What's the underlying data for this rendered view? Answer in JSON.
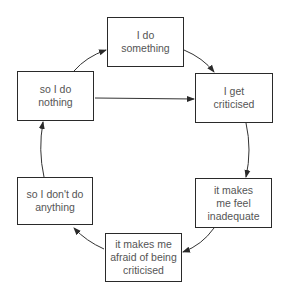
{
  "diagram": {
    "type": "cycle",
    "colors": {
      "stroke": "#2a2a2a",
      "text": "#555555",
      "background": "#ffffff"
    },
    "nodes": [
      {
        "id": "do_something",
        "lines": [
          "I do",
          "something"
        ],
        "x": 107,
        "y": 17,
        "w": 77,
        "h": 50
      },
      {
        "id": "get_criticised",
        "lines": [
          "I get",
          "criticised"
        ],
        "x": 195,
        "y": 73,
        "w": 78,
        "h": 50
      },
      {
        "id": "feel_inadequate",
        "lines": [
          "it makes",
          "me feel",
          "inadequate"
        ],
        "x": 195,
        "y": 178,
        "w": 77,
        "h": 50
      },
      {
        "id": "afraid_criticised",
        "lines": [
          "it makes me",
          "afraid of being",
          "criticised"
        ],
        "x": 105,
        "y": 233,
        "w": 77,
        "h": 49
      },
      {
        "id": "dont_do_anything",
        "lines": [
          "so I don't do",
          "anything"
        ],
        "x": 17,
        "y": 177,
        "w": 76,
        "h": 48
      },
      {
        "id": "do_nothing",
        "lines": [
          "so I do",
          "nothing"
        ],
        "x": 17,
        "y": 71,
        "w": 77,
        "h": 50
      }
    ],
    "edges": [
      {
        "from": "do_something",
        "to": "get_criticised"
      },
      {
        "from": "get_criticised",
        "to": "feel_inadequate"
      },
      {
        "from": "feel_inadequate",
        "to": "afraid_criticised"
      },
      {
        "from": "afraid_criticised",
        "to": "dont_do_anything"
      },
      {
        "from": "dont_do_anything",
        "to": "do_nothing"
      },
      {
        "from": "do_nothing",
        "to": "do_something"
      },
      {
        "from": "do_nothing",
        "to": "get_criticised"
      }
    ]
  }
}
